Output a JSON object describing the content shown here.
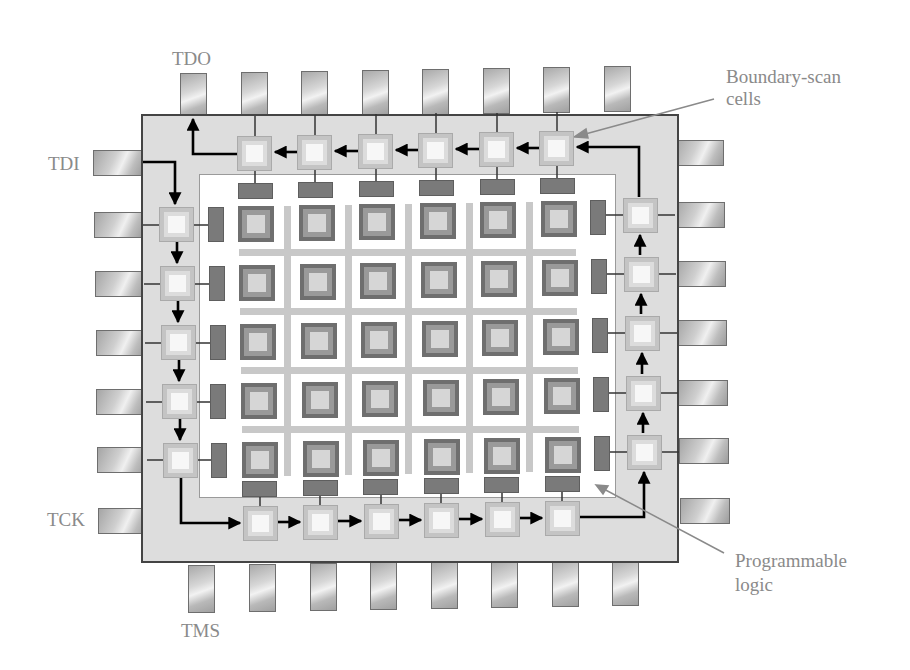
{
  "diagram": {
    "signals": {
      "tdo": "TDO",
      "tdi": "TDI",
      "tck": "TCK",
      "tms": "TMS"
    },
    "callouts": {
      "boundary_scan_line1": "Boundary-scan",
      "boundary_scan_line2": "cells",
      "programmable_line1": "Programmable",
      "programmable_line2": "logic"
    },
    "counts": {
      "pins_top": 8,
      "pins_bottom": 8,
      "pins_left": 7,
      "pins_right": 7,
      "boundary_scan_cells": 22,
      "logic_block_rows": 5,
      "logic_block_cols": 6
    },
    "colors": {
      "label_text": "#8a8a8a",
      "chip_body": "#dddddd",
      "chip_border": "#444444",
      "scan_path": "#000000",
      "logic_block": "#6f6f6f",
      "routing": "#c8c8c8",
      "leader_line": "#8a8a8a"
    }
  }
}
